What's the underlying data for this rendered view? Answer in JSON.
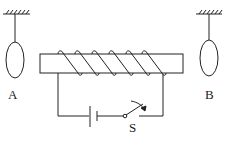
{
  "diagram": {
    "type": "physics-electromagnet",
    "labels": {
      "ring_left": "A",
      "ring_right": "B",
      "switch": "S"
    },
    "coil_turns": 6,
    "colors": {
      "stroke": "#222222",
      "background": "#ffffff"
    }
  }
}
